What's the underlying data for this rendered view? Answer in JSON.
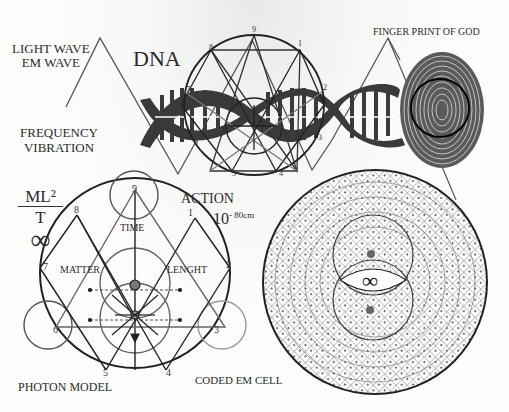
{
  "labels": {
    "light_wave": "LIGHT WAVE",
    "em_wave": "EM WAVE",
    "dna": "DNA",
    "finger_print": "FINGER PRINT OF GOD",
    "frequency": "FREQUENCY",
    "vibration": "VIBRATION",
    "formula_numerator": "ML²",
    "formula_denominator": "T",
    "infinity": "∞",
    "action": "ACTION",
    "scale_base": "10",
    "scale_exp": "- 80cm",
    "time": "TIME",
    "matter": "MATTER",
    "length": "LENGHT",
    "photon_model": "PHOTON MODEL",
    "coded_em_cell": "CODED EM CELL",
    "cell_infinity": "∞"
  },
  "photon_model_points": [
    "9",
    "1",
    "2",
    "3",
    "4",
    "5",
    "6",
    "7",
    "8"
  ],
  "dna_circle_points": [
    "9",
    "1",
    "2",
    "3",
    "4",
    "5",
    "6",
    "7",
    "8"
  ],
  "colors": {
    "ink": "#2a2a2a",
    "gray_line": "#6e6e6e",
    "light_gray": "#a8a8a8",
    "dna_dark": "#3a3a3a"
  }
}
